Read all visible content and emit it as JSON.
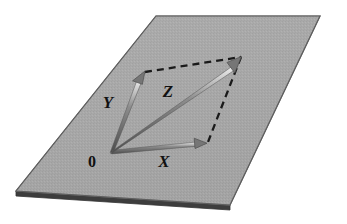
{
  "figure": {
    "background_color": "#ffffff"
  },
  "plane": {
    "name": "shaded-plane",
    "fill_color": "#a9a9a9",
    "edge_color": "#4a4a4a",
    "thickness_color": "#3a3a3a",
    "corners": [
      {
        "label": "top-left",
        "x": 156,
        "y": 16
      },
      {
        "label": "top-right",
        "x": 320,
        "y": 16
      },
      {
        "label": "bottom-right",
        "x": 230,
        "y": 205
      },
      {
        "label": "bottom-left",
        "x": 16,
        "y": 191
      }
    ],
    "thickness_px": 5
  },
  "origin": {
    "label": "0",
    "x": 112,
    "y": 152,
    "label_x": 92,
    "label_y": 167
  },
  "vectors": [
    {
      "name": "vector-x",
      "label": "X",
      "from_x": 112,
      "from_y": 152,
      "to_x": 206,
      "to_y": 143,
      "label_x": 164,
      "label_y": 167,
      "color": "#5a5a5a",
      "highlight_color": "#e8e8e8"
    },
    {
      "name": "vector-y",
      "label": "Y",
      "from_x": 112,
      "from_y": 152,
      "to_x": 145,
      "to_y": 73,
      "label_x": 108,
      "label_y": 108,
      "color": "#5a5a5a",
      "highlight_color": "#e8e8e8"
    },
    {
      "name": "vector-z",
      "label": "Z",
      "from_x": 112,
      "from_y": 152,
      "to_x": 241,
      "to_y": 57,
      "label_x": 168,
      "label_y": 97,
      "color": "#5a5a5a",
      "highlight_color": "#e8e8e8"
    }
  ],
  "dashed_lines": [
    {
      "name": "dashed-line-top",
      "from_x": 145,
      "from_y": 72,
      "to_x": 241,
      "to_y": 57,
      "color": "#1a1a1a",
      "dash_pattern": "7,5"
    },
    {
      "name": "dashed-line-right",
      "from_x": 241,
      "from_y": 57,
      "to_x": 208,
      "to_y": 142,
      "color": "#1a1a1a",
      "dash_pattern": "7,5"
    }
  ],
  "colors": {
    "plane_gray": "#a9a9a9",
    "arrow_gray": "#5a5a5a",
    "dash_black": "#1a1a1a",
    "label_black": "#111111",
    "page_white": "#ffffff"
  }
}
